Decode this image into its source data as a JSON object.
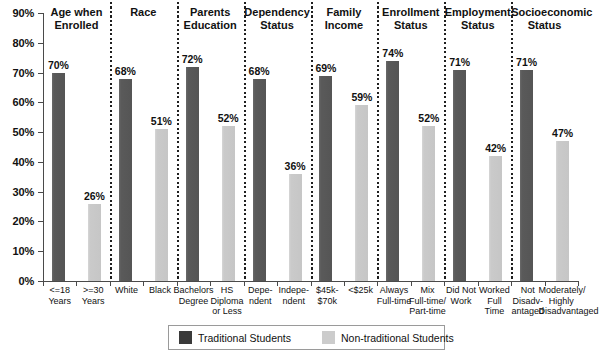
{
  "chart_data": {
    "type": "bar",
    "title": "",
    "xlabel": "",
    "ylabel": "",
    "ylim": [
      0,
      90
    ],
    "ytick_labels": [
      "90%",
      "80%",
      "70%",
      "60%",
      "50%",
      "40%",
      "30%",
      "20%",
      "10%",
      "0%"
    ],
    "ytick_values": [
      90,
      80,
      70,
      60,
      50,
      40,
      30,
      20,
      10,
      0
    ],
    "grid": false,
    "legend_position": "bottom",
    "series": [
      {
        "name": "Traditional Students",
        "color": "#555555"
      },
      {
        "name": "Non-traditional Students",
        "color": "#c6c6c6"
      }
    ],
    "groups": [
      {
        "title": [
          "Age when",
          "Enrolled"
        ],
        "bars": [
          {
            "series": "Traditional Students",
            "category": [
              "<=18",
              "Years"
            ],
            "value": 70,
            "label": "70%"
          },
          {
            "series": "Non-traditional Students",
            "category": [
              ">=30",
              "Years"
            ],
            "value": 26,
            "label": "26%"
          }
        ]
      },
      {
        "title": [
          "Race"
        ],
        "bars": [
          {
            "series": "Traditional Students",
            "category": [
              "White"
            ],
            "value": 68,
            "label": "68%"
          },
          {
            "series": "Non-traditional Students",
            "category": [
              "Black"
            ],
            "value": 51,
            "label": "51%"
          }
        ]
      },
      {
        "title": [
          "Parents",
          "Education"
        ],
        "bars": [
          {
            "series": "Traditional Students",
            "category": [
              "Bachelors",
              "Degree"
            ],
            "value": 72,
            "label": "72%"
          },
          {
            "series": "Non-traditional Students",
            "category": [
              "HS",
              "Diploma",
              "or Less"
            ],
            "value": 52,
            "label": "52%"
          }
        ]
      },
      {
        "title": [
          "Dependency",
          "Status"
        ],
        "bars": [
          {
            "series": "Traditional Students",
            "category": [
              "Depe-",
              "ndent"
            ],
            "value": 68,
            "label": "68%"
          },
          {
            "series": "Non-traditional Students",
            "category": [
              "Indepe-",
              "ndent"
            ],
            "value": 36,
            "label": "36%"
          }
        ]
      },
      {
        "title": [
          "Family",
          "Income"
        ],
        "bars": [
          {
            "series": "Traditional Students",
            "category": [
              "$45k-",
              "$70k"
            ],
            "value": 69,
            "label": "69%"
          },
          {
            "series": "Non-traditional Students",
            "category": [
              "<$25k"
            ],
            "value": 59,
            "label": "59%"
          }
        ]
      },
      {
        "title": [
          "Enrollment",
          "Status"
        ],
        "bars": [
          {
            "series": "Traditional Students",
            "category": [
              "Always",
              "Full-time"
            ],
            "value": 74,
            "label": "74%"
          },
          {
            "series": "Non-traditional Students",
            "category": [
              "Mix",
              "Full-time/",
              "Part-time"
            ],
            "value": 52,
            "label": "52%"
          }
        ]
      },
      {
        "title": [
          "Employment",
          "Status"
        ],
        "bars": [
          {
            "series": "Traditional Students",
            "category": [
              "Did Not",
              "Work"
            ],
            "value": 71,
            "label": "71%"
          },
          {
            "series": "Non-traditional Students",
            "category": [
              "Worked",
              "Full",
              "Time"
            ],
            "value": 42,
            "label": "42%"
          }
        ]
      },
      {
        "title": [
          "Socioeconomic",
          "Status"
        ],
        "bars": [
          {
            "series": "Traditional Students",
            "category": [
              "Not",
              "Disadv-",
              "antaged"
            ],
            "value": 71,
            "label": "71%"
          },
          {
            "series": "Non-traditional Students",
            "category": [
              "Moderately/",
              "Highly",
              "Disadvantaged"
            ],
            "value": 47,
            "label": "47%"
          }
        ]
      }
    ]
  },
  "legend": {
    "items": [
      {
        "label": "Traditional Students",
        "swatch": "trad"
      },
      {
        "label": "Non-traditional Students",
        "swatch": "nontrad"
      }
    ]
  }
}
